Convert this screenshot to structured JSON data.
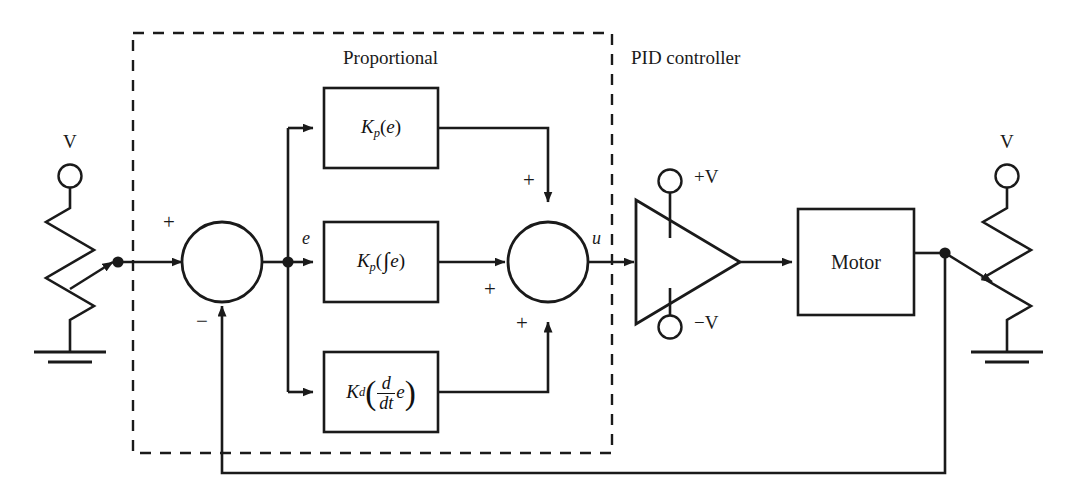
{
  "diagram": {
    "sections": [
      {
        "name": "proportional-section-label",
        "label": "Proportional"
      },
      {
        "name": "pid-controller-label",
        "label": "PID controller"
      }
    ],
    "blocks": [
      {
        "name": "proportional-block",
        "formula_plain": "Kp(e)",
        "gain": "K",
        "gain_sub": "p",
        "operand": "e"
      },
      {
        "name": "integral-block",
        "formula_plain": "Kp(∫e)",
        "gain": "K",
        "gain_sub": "p",
        "operand": "e",
        "integral": "∫"
      },
      {
        "name": "derivative-block",
        "formula_plain": "Kd(d/dt e)",
        "gain": "K",
        "gain_sub": "d",
        "operand": "e",
        "numerator": "d",
        "denominator": "dt"
      },
      {
        "name": "motor-block",
        "label": "Motor"
      }
    ],
    "signals": [
      {
        "name": "error-signal-label",
        "label": "e"
      },
      {
        "name": "control-signal-label",
        "label": "u"
      }
    ],
    "supply_terminals": [
      {
        "name": "amplifier-positive-supply-label",
        "label": "+V"
      },
      {
        "name": "amplifier-negative-supply-label",
        "label": "−V"
      }
    ],
    "source_terminals": [
      {
        "name": "input-potentiometer-voltage-label",
        "label": "V"
      },
      {
        "name": "feedback-potentiometer-voltage-label",
        "label": "V"
      }
    ],
    "junction_signs": {
      "error_junction": [
        {
          "name": "error-junction-plus-sign",
          "label": "+"
        },
        {
          "name": "error-junction-minus-sign",
          "label": "−"
        }
      ],
      "sum_junction": [
        {
          "name": "sum-junction-top-plus-sign",
          "label": "+"
        },
        {
          "name": "sum-junction-left-plus-sign",
          "label": "+"
        },
        {
          "name": "sum-junction-bottom-plus-sign",
          "label": "+"
        }
      ]
    },
    "colors": {
      "line": "#1a1a1a",
      "dashed_border": "#1a1a1a",
      "background": "#ffffff"
    }
  }
}
